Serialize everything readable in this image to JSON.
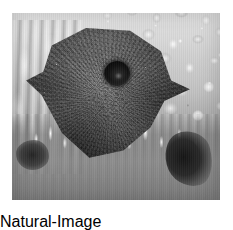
{
  "image": {
    "kind": "photograph",
    "color_mode": "grayscale",
    "caption": "Close-up grayscale photograph of a sea star resting on pebbly substrate",
    "frame": {
      "mat_color": "#ffffff",
      "mat_left": 12,
      "mat_top": 13,
      "photo_width": 208,
      "photo_height": 187
    },
    "palette": {
      "mat": "#ffffff",
      "subject_dark": "#4c4c4c",
      "subject_highlight": "#6d6d6d",
      "pore_black": "#141414",
      "substrate_light": "#e2e2e2",
      "substrate_mid": "#bdbdbd",
      "substrate_shadow": "#6e6e6e",
      "crevice_black": "#1c1c1c"
    },
    "subjects": [
      {
        "name": "sea-star-body",
        "description": "Dark pentagonal star-shaped disc with coarse granular skin texture, occupying the left and centre of the frame",
        "tone": "dark gray"
      },
      {
        "name": "madreporite-pore",
        "description": "Round black sieve-plate opening on the upper right of the disc",
        "tone": "near black",
        "center_x": 117,
        "center_y": 74,
        "diameter": 26
      },
      {
        "name": "pebble-substrate",
        "description": "Field of light rounded pebbles and coral rubble filling the upper-right background",
        "tone": "light gray"
      },
      {
        "name": "spine-fringe",
        "description": "Row of pale pointed spines and tube feet along the lower edge of the disc",
        "tone": "pale gray"
      },
      {
        "name": "left-streaks",
        "description": "Vertical pale streaky projections on the left margin",
        "tone": "mid gray"
      },
      {
        "name": "shadow-crevice",
        "description": "Dark shadowed recess in the lower-right substrate",
        "tone": "black"
      }
    ]
  }
}
